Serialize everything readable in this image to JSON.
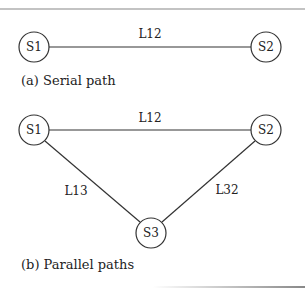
{
  "serial": {
    "caption": "(a) Serial path",
    "nodes": [
      {
        "id": "S1",
        "x": 34,
        "y": 47
      },
      {
        "id": "S2",
        "x": 266,
        "y": 47
      }
    ],
    "links": [
      {
        "label": "L12",
        "from": "S1",
        "to": "S2"
      }
    ]
  },
  "parallel": {
    "caption": "(b) Parallel paths",
    "nodes": [
      {
        "id": "S1",
        "x": 34,
        "y": 130
      },
      {
        "id": "S2",
        "x": 266,
        "y": 130
      },
      {
        "id": "S3",
        "x": 151,
        "y": 233
      }
    ],
    "links": [
      {
        "label": "L12",
        "from": "S1",
        "to": "S2"
      },
      {
        "label": "L13",
        "from": "S1",
        "to": "S3"
      },
      {
        "label": "L32",
        "from": "S3",
        "to": "S2"
      }
    ]
  }
}
